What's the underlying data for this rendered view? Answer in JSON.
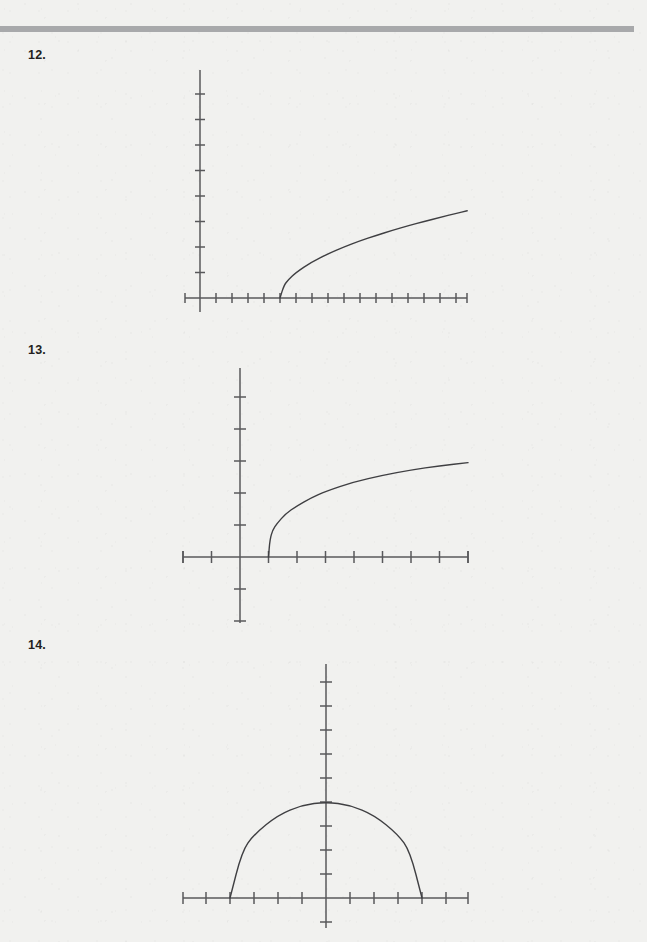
{
  "page": {
    "width": 647,
    "height": 942,
    "background_color": "#f1f1ef",
    "header_rule_color": "#a8a9ab",
    "axis_color": "#58585b",
    "curve_color": "#3f3f42",
    "header_remnant_text": ""
  },
  "problems": [
    {
      "number": "12.",
      "label_top": 48,
      "graph": {
        "origin_x": 200,
        "origin_y": 298,
        "x_axis": {
          "start": 185,
          "end": 467,
          "tick_spacing": 16,
          "tick_half_len": 5
        },
        "y_axis": {
          "start": 70,
          "end": 312,
          "tick_spacing": 25.5,
          "tick_half_len": 5
        },
        "chart_data": {
          "type": "line",
          "title": "",
          "xlabel": "",
          "ylabel": "",
          "grid": false,
          "legend": null,
          "curve": "square-root",
          "description": "Square root curve beginning on the x-axis at x = 5 and increasing to the right",
          "x_start_units": 5,
          "x_end_units": 16.7,
          "x": [
            5,
            5.25,
            5.5,
            6,
            7,
            8,
            9,
            10,
            11,
            12,
            13,
            14,
            15,
            16,
            16.7
          ],
          "y": [
            0,
            0.5,
            0.7,
            1.0,
            1.42,
            1.73,
            2.0,
            2.24,
            2.45,
            2.65,
            2.83,
            3.0,
            3.16,
            3.32,
            3.42
          ],
          "xlim": [
            -0.95,
            16.7
          ],
          "ylim": [
            -0.55,
            8.95
          ]
        }
      }
    },
    {
      "number": "13.",
      "label_top": 343,
      "graph": {
        "origin_x": 240,
        "origin_y": 557,
        "x_axis": {
          "start": 183,
          "end": 468,
          "tick_spacing": 28.5,
          "tick_half_len": 6
        },
        "y_axis": {
          "start": 368,
          "end": 623,
          "tick_spacing": 32,
          "tick_half_len": 6
        },
        "chart_data": {
          "type": "line",
          "title": "",
          "xlabel": "",
          "ylabel": "",
          "grid": false,
          "legend": null,
          "curve": "logarithmic",
          "description": "Logarithmic style curve rising steeply from the x-axis at x = 1 then flattening toward the right",
          "x_start_units": 1,
          "x_end_units": 8,
          "x": [
            1,
            1.05,
            1.15,
            1.3,
            1.6,
            2,
            2.5,
            3,
            4,
            5,
            6,
            7,
            8
          ],
          "y": [
            0,
            0.55,
            0.85,
            1.05,
            1.35,
            1.6,
            1.85,
            2.05,
            2.35,
            2.55,
            2.72,
            2.85,
            2.95
          ],
          "xlim": [
            -2,
            8
          ],
          "ylim": [
            -2.1,
            5.9
          ]
        }
      }
    },
    {
      "number": "14.",
      "label_top": 638,
      "graph": {
        "origin_x": 326,
        "origin_y": 898,
        "x_axis": {
          "start": 183,
          "end": 468,
          "tick_spacing": 24,
          "tick_half_len": 6
        },
        "y_axis": {
          "start": 664,
          "end": 928,
          "tick_spacing": 24,
          "tick_half_len": 6
        },
        "chart_data": {
          "type": "line",
          "title": "",
          "xlabel": "",
          "ylabel": "",
          "grid": false,
          "legend": null,
          "curve": "semicircle",
          "description": "Upper half of a circle centered at the origin with radius 4, meeting the x-axis at x = -4 and x = 4",
          "radius_units": 4,
          "center": [
            0,
            0
          ],
          "x": [
            -4,
            -3.5,
            -3,
            -2,
            -1,
            0,
            1,
            2,
            3,
            3.5,
            4
          ],
          "y": [
            0,
            1.94,
            2.65,
            3.46,
            3.87,
            4.0,
            3.87,
            3.46,
            2.65,
            1.94,
            0
          ],
          "xlim": [
            -6,
            6
          ],
          "ylim": [
            -1.25,
            9.75
          ]
        }
      }
    }
  ]
}
